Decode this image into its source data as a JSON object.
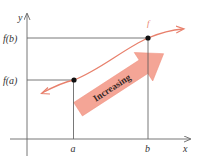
{
  "diagram": {
    "axes": {
      "x_label": "x",
      "y_label": "y"
    },
    "x_ticks": [
      {
        "label": "a"
      },
      {
        "label": "b"
      }
    ],
    "y_ticks": [
      {
        "label": "f(a)"
      },
      {
        "label": "f(b)"
      }
    ],
    "curve": {
      "label": "f",
      "color": "#e8806c"
    },
    "points": [
      {
        "name": "A",
        "x_label": "a",
        "y_label": "f(a)"
      },
      {
        "name": "B",
        "x_label": "b",
        "y_label": "f(b)"
      }
    ],
    "big_arrow": {
      "label": "Increasing",
      "color": "#f4a596"
    },
    "colors": {
      "axis": "#555555",
      "guide_lines": "#555555",
      "curve": "#e8806c",
      "arrow_fill": "#f4a596",
      "point": "#111111"
    }
  }
}
